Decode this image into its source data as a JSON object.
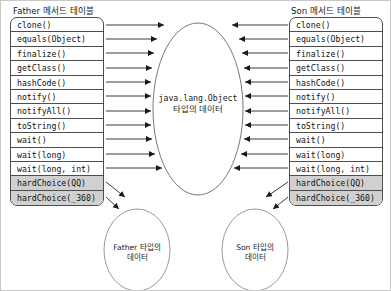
{
  "diagram": {
    "title_left": "Father 메서드 테이블",
    "title_right": "Son 메서드 테이블",
    "center_node": {
      "line1": "java.lang.Object",
      "line2": "타입의 데이터"
    },
    "bottom_left_node": {
      "line1": "Father 타입의",
      "line2": "데이터"
    },
    "bottom_right_node": {
      "line1": "Son 타입의",
      "line2": "데이터"
    },
    "father_methods": [
      {
        "label": "clone()",
        "highlight": false
      },
      {
        "label": "equals(Object)",
        "highlight": false
      },
      {
        "label": "finalize()",
        "highlight": false
      },
      {
        "label": "getClass()",
        "highlight": false
      },
      {
        "label": "hashCode()",
        "highlight": false
      },
      {
        "label": "notify()",
        "highlight": false
      },
      {
        "label": "notifyAll()",
        "highlight": false
      },
      {
        "label": "toString()",
        "highlight": false
      },
      {
        "label": "wait()",
        "highlight": false
      },
      {
        "label": "wait(long)",
        "highlight": false
      },
      {
        "label": "wait(long, int)",
        "highlight": false
      },
      {
        "label": "hardChoice(QQ)",
        "highlight": true
      },
      {
        "label": "hardChoice(_360)",
        "highlight": true
      }
    ],
    "son_methods": [
      {
        "label": "clone()",
        "highlight": false
      },
      {
        "label": "equals(Object)",
        "highlight": false
      },
      {
        "label": "finalize()",
        "highlight": false
      },
      {
        "label": "getClass()",
        "highlight": false
      },
      {
        "label": "hashCode()",
        "highlight": false
      },
      {
        "label": "notify()",
        "highlight": false
      },
      {
        "label": "notifyAll()",
        "highlight": false
      },
      {
        "label": "toString()",
        "highlight": false
      },
      {
        "label": "wait()",
        "highlight": false
      },
      {
        "label": "wait(long)",
        "highlight": false
      },
      {
        "label": "wait(long, int)",
        "highlight": false
      },
      {
        "label": "hardChoice(QQ)",
        "highlight": true
      },
      {
        "label": "hardChoice(_360)",
        "highlight": true
      }
    ],
    "colors": {
      "line": "#4d4d4d",
      "ellipse_stroke": "#777777",
      "highlight_fill": "#d0d0d0",
      "background": "#ffffff",
      "text": "#1a1a1a"
    }
  }
}
